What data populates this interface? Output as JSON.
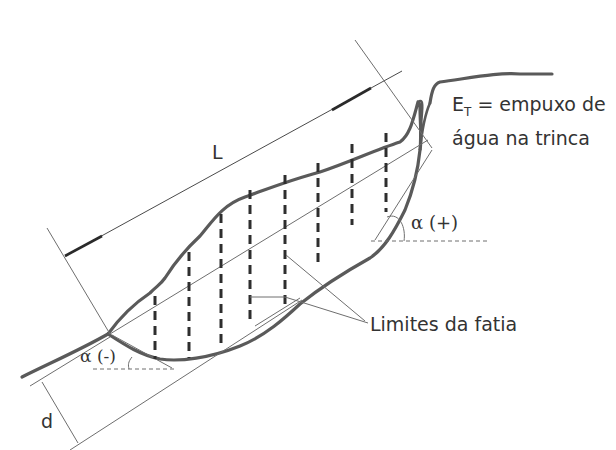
{
  "diagram": {
    "type": "slope-stability-slice-method",
    "labels": {
      "length": "L",
      "depth": "d",
      "crack_force_symbol": "E",
      "crack_force_subscript": "T",
      "crack_force_line1": " = empuxo de",
      "crack_force_line2": "água na trinca",
      "alpha_positive": "α (+)",
      "alpha_negative": "α (-)",
      "slice_limits": "Limites da fatia"
    },
    "slice_count": 7,
    "colors": {
      "thick_line": "#5a5a5a",
      "thin_line": "#6e6e6e",
      "dashed_slice": "#2e2e2e",
      "text": "#333333"
    }
  }
}
